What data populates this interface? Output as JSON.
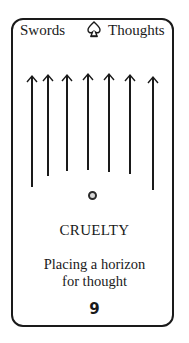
{
  "card": {
    "suit_label": "Swords",
    "realm_label": "Thoughts",
    "suit_icon": "spade-icon",
    "title": "CRUELTY",
    "description_line1": "Placing a horizon",
    "description_line2": "for thought",
    "number": "9",
    "arrow_count": 7,
    "arrows": [
      {
        "x": 32,
        "top": 76,
        "bottom": 187
      },
      {
        "x": 48,
        "top": 75,
        "bottom": 176
      },
      {
        "x": 67,
        "top": 75,
        "bottom": 171
      },
      {
        "x": 88,
        "top": 74,
        "bottom": 170
      },
      {
        "x": 109,
        "top": 74,
        "bottom": 172
      },
      {
        "x": 130,
        "top": 75,
        "bottom": 174
      },
      {
        "x": 153,
        "top": 77,
        "bottom": 190
      }
    ],
    "colors": {
      "ink": "#1a1a1a",
      "dot_fill": "#d8d8d8",
      "background": "#ffffff"
    }
  }
}
